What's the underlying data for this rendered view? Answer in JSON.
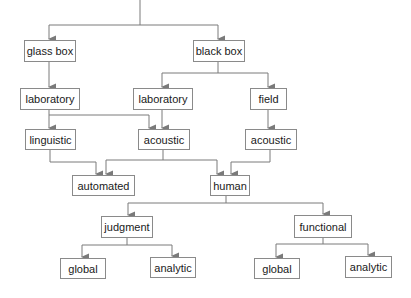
{
  "diagram": {
    "type": "tree",
    "line_color": "#7a7a7a",
    "border_color": "#8a8a8a",
    "nodes": [
      {
        "id": "glass_box",
        "label": "glass box",
        "x": 24,
        "y": 40,
        "w": 52,
        "h": 22
      },
      {
        "id": "black_box",
        "label": "black box",
        "x": 193,
        "y": 40,
        "w": 52,
        "h": 22
      },
      {
        "id": "lab_left",
        "label": "laboratory",
        "x": 20,
        "y": 88,
        "w": 60,
        "h": 22
      },
      {
        "id": "lab_mid",
        "label": "laboratory",
        "x": 133,
        "y": 88,
        "w": 60,
        "h": 22
      },
      {
        "id": "field",
        "label": "field",
        "x": 250,
        "y": 88,
        "w": 37,
        "h": 22
      },
      {
        "id": "linguistic",
        "label": "linguistic",
        "x": 25,
        "y": 129,
        "w": 51,
        "h": 21
      },
      {
        "id": "acoustic_mid",
        "label": "acoustic",
        "x": 138,
        "y": 129,
        "w": 52,
        "h": 21
      },
      {
        "id": "acoustic_right",
        "label": "acoustic",
        "x": 245,
        "y": 129,
        "w": 52,
        "h": 21
      },
      {
        "id": "automated",
        "label": "automated",
        "x": 72,
        "y": 175,
        "w": 63,
        "h": 21
      },
      {
        "id": "human",
        "label": "human",
        "x": 210,
        "y": 175,
        "w": 40,
        "h": 21
      },
      {
        "id": "judgment",
        "label": "judgment",
        "x": 101,
        "y": 216,
        "w": 52,
        "h": 22
      },
      {
        "id": "functional",
        "label": "functional",
        "x": 294,
        "y": 215,
        "w": 58,
        "h": 23
      },
      {
        "id": "global_left",
        "label": "global",
        "x": 60,
        "y": 258,
        "w": 46,
        "h": 21
      },
      {
        "id": "analytic_left",
        "label": "analytic",
        "x": 150,
        "y": 257,
        "w": 46,
        "h": 21
      },
      {
        "id": "global_right",
        "label": "global",
        "x": 254,
        "y": 258,
        "w": 46,
        "h": 21
      },
      {
        "id": "analytic_right",
        "label": "analytic",
        "x": 345,
        "y": 256,
        "w": 47,
        "h": 22
      }
    ],
    "edges": [
      [
        "root",
        "glass_box"
      ],
      [
        "root",
        "black_box"
      ],
      [
        "glass_box",
        "lab_left"
      ],
      [
        "black_box",
        "lab_mid"
      ],
      [
        "black_box",
        "field"
      ],
      [
        "lab_left",
        "linguistic"
      ],
      [
        "lab_left",
        "acoustic_mid"
      ],
      [
        "lab_mid",
        "acoustic_mid"
      ],
      [
        "field",
        "acoustic_right"
      ],
      [
        "linguistic",
        "automated"
      ],
      [
        "acoustic_mid",
        "automated"
      ],
      [
        "acoustic_mid",
        "human"
      ],
      [
        "acoustic_right",
        "human"
      ],
      [
        "human",
        "judgment"
      ],
      [
        "human",
        "functional"
      ],
      [
        "judgment",
        "global_left"
      ],
      [
        "judgment",
        "analytic_left"
      ],
      [
        "functional",
        "global_right"
      ],
      [
        "functional",
        "analytic_right"
      ]
    ]
  }
}
